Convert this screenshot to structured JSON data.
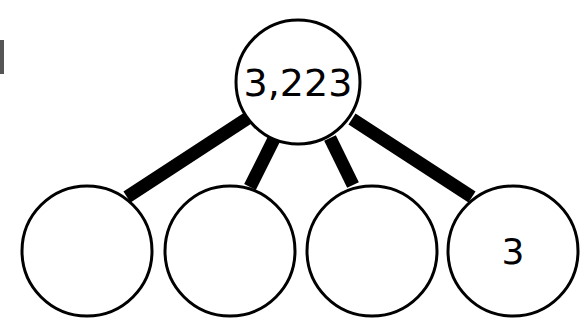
{
  "diagram": {
    "type": "place-value-decomposition",
    "top": {
      "value": "3,223",
      "cx": 298,
      "cy": 82,
      "r": 62
    },
    "bottom": [
      {
        "value": "",
        "cx": 87,
        "cy": 251,
        "r": 65
      },
      {
        "value": "",
        "cx": 230,
        "cy": 251,
        "r": 65
      },
      {
        "value": "",
        "cx": 372,
        "cy": 251,
        "r": 65
      },
      {
        "value": "3",
        "cx": 513,
        "cy": 251,
        "r": 65
      }
    ],
    "colors": {
      "stroke": "#000000",
      "fill": "#ffffff"
    }
  }
}
